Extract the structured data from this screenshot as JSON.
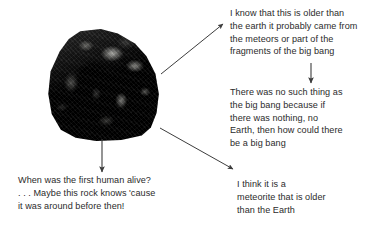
{
  "page": {
    "background_color": "#ffffff",
    "text_color": "#2b2b2b",
    "arrow_color": "#3d3d3d"
  },
  "image": {
    "subject_name": "rock-photo",
    "alt": "dark grey rock / meteorite specimen"
  },
  "notes": [
    {
      "id": "note-older-than-earth",
      "name": "note-older-than-earth",
      "text": "I know that this is older than\nthe earth it probably came from\nthe meteors or part of the\nfragments of the big bang"
    },
    {
      "id": "note-no-big-bang",
      "name": "note-no-big-bang",
      "text": "There was no such thing as\nthe big bang because if\nthere was nothing, no\nEarth, then how could there\nbe a big bang"
    },
    {
      "id": "note-first-human",
      "name": "note-first-human",
      "text": "When was the first human alive?\n. . . Maybe this rock knows 'cause\nit was around before then!"
    },
    {
      "id": "note-meteorite",
      "name": "note-meteorite",
      "text": "I think it is a\nmeteorite that is older\nthan the Earth"
    }
  ],
  "arrows": [
    {
      "id": "arrow-rock-to-older-than-earth",
      "name": "arrow-rock-to-note-older-than-earth",
      "from": "rock-photo",
      "to": "note-older-than-earth",
      "x1": 161,
      "y1": 74,
      "x2": 223,
      "y2": 24
    },
    {
      "id": "arrow-older-to-no-big-bang",
      "name": "arrow-note-older-to-note-no-big-bang",
      "from": "note-older-than-earth",
      "to": "note-no-big-bang",
      "x1": 311,
      "y1": 63,
      "x2": 311,
      "y2": 83
    },
    {
      "id": "arrow-rock-to-first-human",
      "name": "arrow-rock-to-note-first-human",
      "from": "rock-photo",
      "to": "note-first-human",
      "x1": 102,
      "y1": 139,
      "x2": 102,
      "y2": 172
    },
    {
      "id": "arrow-rock-to-meteorite",
      "name": "arrow-rock-to-note-meteorite",
      "from": "rock-photo",
      "to": "note-meteorite",
      "x1": 160,
      "y1": 128,
      "x2": 233,
      "y2": 169
    }
  ]
}
